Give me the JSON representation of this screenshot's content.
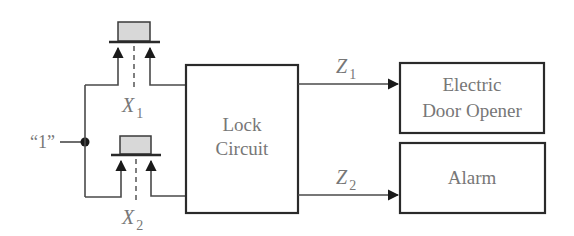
{
  "diagram": {
    "source_label": "“1”",
    "inputs": [
      {
        "name": "X",
        "subscript": "1"
      },
      {
        "name": "X",
        "subscript": "2"
      }
    ],
    "lock_box": {
      "line1": "Lock",
      "line2": "Circuit"
    },
    "outputs": [
      {
        "name": "Z",
        "subscript": "1",
        "target_line1": "Electric",
        "target_line2": "Door Opener"
      },
      {
        "name": "Z",
        "subscript": "2",
        "target_line1": "Alarm"
      }
    ],
    "colors": {
      "line": "#2a2a2a",
      "text": "#777777",
      "button_fill": "#d8d8d8"
    }
  }
}
